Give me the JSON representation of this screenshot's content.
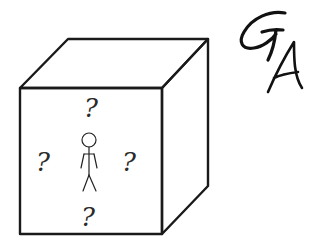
{
  "diagram": {
    "cube": {
      "front_face": {
        "x": 20,
        "y": 88,
        "width": 142,
        "height": 146
      },
      "depth_offset": {
        "dx": 46,
        "dy": -49
      },
      "stroke_color": "#1a1a1a"
    },
    "figure": {
      "type": "stick-figure",
      "head_center": [
        89,
        140
      ],
      "head_radius": 7
    },
    "question_marks": [
      {
        "label": "?",
        "position": "above",
        "x": 91,
        "y": 113
      },
      {
        "label": "?",
        "position": "left",
        "x": 43,
        "y": 168
      },
      {
        "label": "?",
        "position": "right",
        "x": 129,
        "y": 168
      },
      {
        "label": "?",
        "position": "below",
        "x": 88,
        "y": 223
      }
    ],
    "signature": {
      "text": "GA",
      "letters": [
        "G",
        "A"
      ]
    }
  }
}
